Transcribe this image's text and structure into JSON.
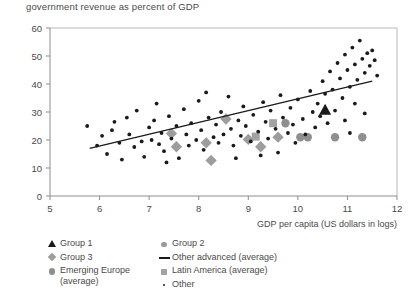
{
  "chart_data": {
    "type": "scatter",
    "title": "government revenue as percent of GDP",
    "xlabel": "GDP per capita (US dollars in logs)",
    "ylabel": "",
    "xlim": [
      5,
      12
    ],
    "ylim": [
      0,
      60
    ],
    "xticks": [
      "5",
      "6",
      "7",
      "8",
      "9",
      "10",
      "11",
      "12"
    ],
    "yticks": [
      "0",
      "10",
      "20",
      "30",
      "40",
      "50",
      "60"
    ],
    "grid": false,
    "legend_position": "below-left",
    "series": [
      {
        "name": "Group 1",
        "marker": "triangle",
        "color": "#1a1a1a",
        "points": [
          [
            10.55,
            31.0
          ]
        ]
      },
      {
        "name": "Group 2",
        "marker": "circle",
        "color": "#8f8f8f",
        "points": [
          [
            10.2,
            21.0
          ],
          [
            10.75,
            21.0
          ],
          [
            11.3,
            21.0
          ]
        ]
      },
      {
        "name": "Group 3",
        "marker": "diamond",
        "color": "#9d9d9d",
        "points": [
          [
            7.45,
            22.3
          ],
          [
            7.55,
            17.6
          ],
          [
            8.15,
            19.0
          ],
          [
            8.25,
            12.7
          ],
          [
            8.55,
            27.5
          ],
          [
            9.0,
            20.2
          ],
          [
            9.25,
            17.6
          ],
          [
            9.6,
            21.0
          ]
        ]
      },
      {
        "name": "Emerging Europe (average)",
        "marker": "circle",
        "color": "#8f8f8f",
        "points": [
          [
            9.75,
            26.0
          ],
          [
            10.05,
            21.0
          ]
        ]
      },
      {
        "name": "Latin America (average)",
        "marker": "square",
        "color": "#a3a3a3",
        "points": [
          [
            9.5,
            26.0
          ],
          [
            9.15,
            21.2
          ]
        ]
      },
      {
        "name": "Other advanced (average)",
        "marker": "line",
        "color": "#1a1a1a",
        "points": []
      },
      {
        "name": "Other",
        "marker": "dot",
        "color": "#1a1a1a",
        "points": [
          [
            5.75,
            25.0
          ],
          [
            6.05,
            21.5
          ],
          [
            6.15,
            15.0
          ],
          [
            6.3,
            26.5
          ],
          [
            6.4,
            19.0
          ],
          [
            6.45,
            13.0
          ],
          [
            6.6,
            22.0
          ],
          [
            6.7,
            17.5
          ],
          [
            6.75,
            30.5
          ],
          [
            6.85,
            19.5
          ],
          [
            6.9,
            14.0
          ],
          [
            7.0,
            24.5
          ],
          [
            7.05,
            20.0
          ],
          [
            7.1,
            27.0
          ],
          [
            7.2,
            18.5
          ],
          [
            7.25,
            22.5
          ],
          [
            7.3,
            16.0
          ],
          [
            7.4,
            28.5
          ],
          [
            7.45,
            20.5
          ],
          [
            7.55,
            25.0
          ],
          [
            7.6,
            13.5
          ],
          [
            7.7,
            31.0
          ],
          [
            7.75,
            22.0
          ],
          [
            7.8,
            18.0
          ],
          [
            7.85,
            26.0
          ],
          [
            7.95,
            20.0
          ],
          [
            8.0,
            34.0
          ],
          [
            8.05,
            23.5
          ],
          [
            8.1,
            16.5
          ],
          [
            8.2,
            28.0
          ],
          [
            8.3,
            21.0
          ],
          [
            8.35,
            25.5
          ],
          [
            8.4,
            19.0
          ],
          [
            8.45,
            30.0
          ],
          [
            8.5,
            22.0
          ],
          [
            8.6,
            35.5
          ],
          [
            8.65,
            24.0
          ],
          [
            8.7,
            18.0
          ],
          [
            8.8,
            27.0
          ],
          [
            8.85,
            21.5
          ],
          [
            8.9,
            32.0
          ],
          [
            8.95,
            25.0
          ],
          [
            9.05,
            19.5
          ],
          [
            9.1,
            29.0
          ],
          [
            9.2,
            23.0
          ],
          [
            9.3,
            33.5
          ],
          [
            9.35,
            26.5
          ],
          [
            9.4,
            20.5
          ],
          [
            9.45,
            30.5
          ],
          [
            9.55,
            24.0
          ],
          [
            9.65,
            36.0
          ],
          [
            9.7,
            28.0
          ],
          [
            9.8,
            22.5
          ],
          [
            9.85,
            31.5
          ],
          [
            9.9,
            25.5
          ],
          [
            9.95,
            19.0
          ],
          [
            10.0,
            34.5
          ],
          [
            10.1,
            27.5
          ],
          [
            10.15,
            22.0
          ],
          [
            10.25,
            37.5
          ],
          [
            10.3,
            30.0
          ],
          [
            10.35,
            24.5
          ],
          [
            10.4,
            33.0
          ],
          [
            10.45,
            28.5
          ],
          [
            10.5,
            41.0
          ],
          [
            10.55,
            36.5
          ],
          [
            10.6,
            26.0
          ],
          [
            10.65,
            44.5
          ],
          [
            10.7,
            38.0
          ],
          [
            10.75,
            30.5
          ],
          [
            10.8,
            47.5
          ],
          [
            10.85,
            42.0
          ],
          [
            10.9,
            35.0
          ],
          [
            10.95,
            50.5
          ],
          [
            11.0,
            45.0
          ],
          [
            11.05,
            39.0
          ],
          [
            11.1,
            53.0
          ],
          [
            11.15,
            47.0
          ],
          [
            11.2,
            41.5
          ],
          [
            11.25,
            55.5
          ],
          [
            11.3,
            49.0
          ],
          [
            11.35,
            44.0
          ],
          [
            11.4,
            51.0
          ],
          [
            11.45,
            46.5
          ],
          [
            11.5,
            52.0
          ],
          [
            11.55,
            48.5
          ],
          [
            11.6,
            43.0
          ],
          [
            11.15,
            33.0
          ],
          [
            11.35,
            29.5
          ],
          [
            10.95,
            27.0
          ],
          [
            11.05,
            22.5
          ],
          [
            6.55,
            28.0
          ],
          [
            7.15,
            33.0
          ],
          [
            8.75,
            13.5
          ],
          [
            9.25,
            14.5
          ],
          [
            5.95,
            18.0
          ],
          [
            6.25,
            23.5
          ],
          [
            7.35,
            12.0
          ],
          [
            8.15,
            37.0
          ],
          [
            9.6,
            15.5
          ]
        ]
      }
    ],
    "trendline": {
      "name": "Other advanced (average)",
      "x0": 5.8,
      "y0": 17.0,
      "x1": 11.5,
      "y1": 41.0,
      "color": "#1a1a1a"
    }
  },
  "legend": {
    "left_column": [
      {
        "label": "Group 1",
        "marker": "triangle"
      },
      {
        "label": "Group 3",
        "marker": "diamond"
      },
      {
        "label": "Emerging Europe\n(average)",
        "marker": "circle-big"
      }
    ],
    "right_column": [
      {
        "label": "Group 2",
        "marker": "circle-mid"
      },
      {
        "label": "Other advanced (average)",
        "marker": "line"
      },
      {
        "label": "Latin America (average)",
        "marker": "square"
      },
      {
        "label": "Other",
        "marker": "dot"
      }
    ]
  }
}
